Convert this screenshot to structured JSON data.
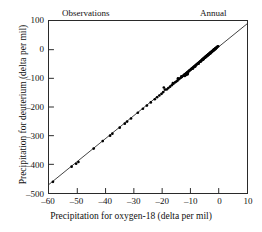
{
  "chart_data": {
    "type": "scatter",
    "title": "",
    "xlabel": "Precipitation for oxygen-18 (delta per mil)",
    "ylabel": "Precipitation for deuterium (delta per mil)",
    "xlim": [
      -60,
      10
    ],
    "ylim": [
      -500,
      100
    ],
    "xticks": [
      -60,
      -50,
      -40,
      -30,
      -20,
      -10,
      0,
      10
    ],
    "yticks": [
      -500,
      -400,
      -300,
      -200,
      -100,
      0,
      100
    ],
    "xtick_labels": [
      "-60",
      "-50",
      "-40",
      "-30",
      "-20",
      "-10",
      "0",
      "10"
    ],
    "ytick_labels": [
      "-500",
      "-400",
      "-300",
      "-200",
      "-100",
      "0",
      "100"
    ],
    "grid": false,
    "legend": false,
    "annotations": [
      {
        "text": "Observations",
        "position": "top-left"
      },
      {
        "text": "Annual",
        "position": "top-right"
      }
    ],
    "series": [
      {
        "name": "Observations",
        "type": "scatter",
        "marker": "filled-circle",
        "color": "#000000",
        "points": [
          [
            -58.6,
            -461
          ],
          [
            -52.0,
            -408
          ],
          [
            -50.4,
            -398
          ],
          [
            -49.6,
            -392
          ],
          [
            -44.2,
            -345
          ],
          [
            -41.0,
            -319
          ],
          [
            -38.4,
            -300
          ],
          [
            -37.6,
            -293
          ],
          [
            -35.0,
            -272
          ],
          [
            -33.2,
            -258
          ],
          [
            -32.4,
            -251
          ],
          [
            -31.0,
            -240
          ],
          [
            -28.6,
            -220
          ],
          [
            -26.8,
            -206
          ],
          [
            -25.4,
            -195
          ],
          [
            -24.0,
            -184
          ],
          [
            -22.6,
            -173
          ],
          [
            -21.8,
            -166
          ],
          [
            -21.0,
            -160
          ],
          [
            -20.2,
            -154
          ],
          [
            -19.6,
            -148
          ],
          [
            -19.0,
            -139
          ],
          [
            -18.4,
            -139
          ],
          [
            -17.8,
            -134
          ],
          [
            -17.2,
            -129
          ],
          [
            -16.6,
            -124
          ],
          [
            -16.0,
            -119
          ],
          [
            -15.4,
            -114
          ],
          [
            -15.0,
            -111
          ],
          [
            -14.6,
            -108
          ],
          [
            -14.2,
            -104
          ],
          [
            -13.8,
            -101
          ],
          [
            -13.4,
            -98
          ],
          [
            -13.0,
            -95
          ],
          [
            -12.6,
            -91
          ],
          [
            -12.4,
            -90
          ],
          [
            -12.2,
            -88
          ],
          [
            -12.0,
            -86
          ],
          [
            -11.8,
            -85
          ],
          [
            -11.6,
            -83
          ],
          [
            -11.4,
            -82
          ],
          [
            -11.2,
            -80
          ],
          [
            -11.0,
            -78
          ],
          [
            -11.0,
            -86
          ],
          [
            -10.8,
            -77
          ],
          [
            -10.6,
            -75
          ],
          [
            -10.4,
            -73
          ],
          [
            -10.2,
            -72
          ],
          [
            -10.0,
            -70
          ],
          [
            -9.8,
            -68
          ],
          [
            -9.6,
            -67
          ],
          [
            -9.4,
            -65
          ],
          [
            -9.2,
            -63
          ],
          [
            -9.0,
            -62
          ],
          [
            -8.8,
            -60
          ],
          [
            -8.6,
            -58
          ],
          [
            -8.4,
            -57
          ],
          [
            -8.2,
            -55
          ],
          [
            -8.0,
            -53
          ],
          [
            -7.8,
            -52
          ],
          [
            -7.6,
            -50
          ],
          [
            -7.4,
            -48
          ],
          [
            -7.2,
            -47
          ],
          [
            -7.0,
            -45
          ],
          [
            -6.8,
            -43
          ],
          [
            -6.6,
            -42
          ],
          [
            -6.4,
            -40
          ],
          [
            -6.2,
            -38
          ],
          [
            -6.0,
            -37
          ],
          [
            -5.9,
            -36
          ],
          [
            -5.8,
            -35
          ],
          [
            -5.7,
            -34
          ],
          [
            -5.6,
            -33
          ],
          [
            -5.5,
            -32
          ],
          [
            -5.4,
            -32
          ],
          [
            -5.3,
            -31
          ],
          [
            -5.2,
            -30
          ],
          [
            -5.1,
            -29
          ],
          [
            -5.0,
            -28
          ],
          [
            -4.9,
            -27
          ],
          [
            -4.8,
            -26
          ],
          [
            -4.7,
            -25
          ],
          [
            -4.6,
            -25
          ],
          [
            -4.5,
            -24
          ],
          [
            -4.4,
            -23
          ],
          [
            -4.3,
            -22
          ],
          [
            -4.2,
            -21
          ],
          [
            -4.1,
            -20
          ],
          [
            -4.0,
            -20
          ],
          [
            -3.9,
            -19
          ],
          [
            -3.8,
            -18
          ],
          [
            -3.7,
            -17
          ],
          [
            -3.6,
            -16
          ],
          [
            -3.5,
            -15
          ],
          [
            -3.4,
            -15
          ],
          [
            -3.3,
            -14
          ],
          [
            -3.2,
            -13
          ],
          [
            -3.1,
            -12
          ],
          [
            -3.0,
            -11
          ],
          [
            -2.9,
            -10
          ],
          [
            -2.8,
            -10
          ],
          [
            -2.7,
            -9
          ],
          [
            -2.6,
            -8
          ],
          [
            -2.5,
            -7
          ],
          [
            -2.4,
            -6
          ],
          [
            -2.3,
            -5
          ],
          [
            -2.2,
            -5
          ],
          [
            -2.1,
            -4
          ],
          [
            -2.0,
            -3
          ],
          [
            -1.9,
            -2
          ],
          [
            -1.8,
            -1
          ],
          [
            -1.7,
            0
          ],
          [
            -1.6,
            0
          ],
          [
            -1.5,
            1
          ],
          [
            -1.4,
            2
          ],
          [
            -1.3,
            3
          ],
          [
            -1.2,
            4
          ],
          [
            -1.1,
            5
          ],
          [
            -1.0,
            5
          ],
          [
            -0.9,
            6
          ],
          [
            -0.8,
            7
          ],
          [
            -0.6,
            9
          ],
          [
            -0.4,
            11
          ],
          [
            -0.2,
            12
          ],
          [
            -12.0,
            -92
          ],
          [
            -11.5,
            -88
          ],
          [
            -11.3,
            -84
          ],
          [
            -10.9,
            -81
          ],
          [
            -9.1,
            -66
          ],
          [
            -8.3,
            -59
          ],
          [
            -7.1,
            -49
          ],
          [
            -6.3,
            -41
          ],
          [
            -5.45,
            -34
          ],
          [
            -4.75,
            -28
          ],
          [
            -4.15,
            -23
          ],
          [
            -3.55,
            -18
          ],
          [
            -2.95,
            -13
          ],
          [
            -2.35,
            -8
          ],
          [
            -1.75,
            -3
          ],
          [
            -1.15,
            2
          ],
          [
            -19.4,
            -132
          ],
          [
            -16.2,
            -117
          ],
          [
            -14.4,
            -100
          ],
          [
            -13.2,
            -93
          ]
        ]
      },
      {
        "name": "Meteoric water line",
        "type": "line",
        "color": "#111111",
        "endpoints": [
          [
            -60,
            -470
          ],
          [
            10,
            90
          ]
        ]
      }
    ]
  },
  "axes": {
    "x_title": "Precipitation for oxygen-18 (delta per mil)",
    "y_title": "Precipitation for deuterium (delta per mil)"
  },
  "notes": {
    "observations": "Observations",
    "annual": "Annual"
  }
}
